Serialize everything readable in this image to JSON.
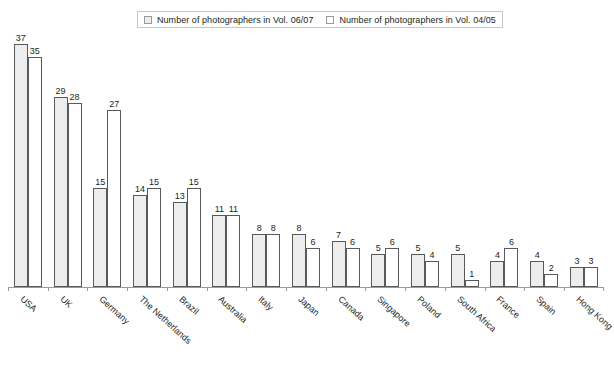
{
  "legend": {
    "entries": [
      {
        "label": "Number of photographers in Vol. 06/07",
        "swatch": "legend-swatch-grey"
      },
      {
        "label": "Number of photographers in Vol. 04/05",
        "swatch": "legend-swatch-white"
      }
    ]
  },
  "chart_data": {
    "type": "bar",
    "title": "",
    "subtitle": "",
    "xlabel": "",
    "ylabel": "",
    "grid": false,
    "legend_position": "top-center",
    "ylim": [
      0,
      37
    ],
    "categories": [
      "USA",
      "UK",
      "Germany",
      "The Netherlands",
      "Brazil",
      "Australia",
      "Italy",
      "Japan",
      "Canada",
      "Singapore",
      "Poland",
      "South Africa",
      "France",
      "Spain",
      "Hong Kong"
    ],
    "series": [
      {
        "name": "Number of photographers in Vol. 06/07",
        "color": "#ededed",
        "values": [
          37,
          29,
          15,
          14,
          13,
          11,
          8,
          8,
          7,
          5,
          5,
          5,
          4,
          4,
          3
        ]
      },
      {
        "name": "Number of photographers in Vol. 04/05",
        "color": "#ffffff",
        "values": [
          35,
          28,
          27,
          15,
          15,
          11,
          8,
          6,
          6,
          6,
          4,
          1,
          6,
          2,
          3
        ]
      }
    ]
  },
  "colors": {
    "series_a_fill": "#ededed",
    "series_b_fill": "#ffffff",
    "bar_stroke": "#58595b",
    "axis": "#9a9a9a",
    "text": "#231f20",
    "legend_border": "#c8c8c8",
    "background": "#ffffff"
  }
}
